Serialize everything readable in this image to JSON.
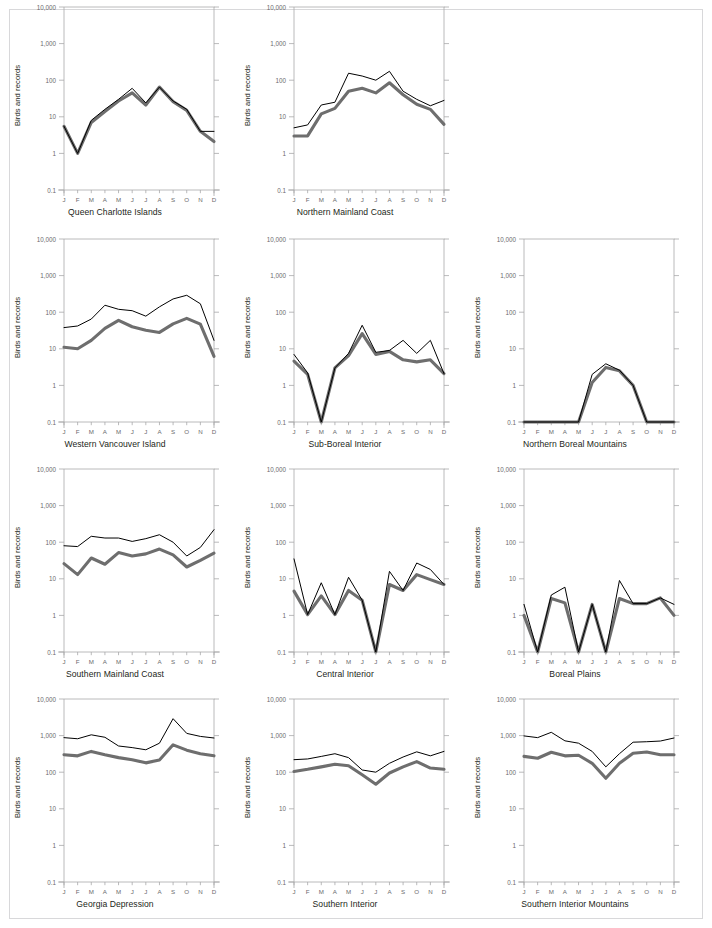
{
  "figure": {
    "axis_label_y": "Birds and records",
    "y_ticks": [
      "10,000",
      "1,000",
      "100",
      "10",
      "1",
      "0.1"
    ],
    "x_ticks": [
      "J",
      "F",
      "M",
      "A",
      "M",
      "J",
      "J",
      "A",
      "S",
      "O",
      "N",
      "D"
    ],
    "colors": {
      "records_line": "#000000",
      "birds_line": "#6e6e6e",
      "axis": "#a8a8aa",
      "frame": "#d8d8da",
      "text": "#231f20"
    },
    "layout": {
      "columns": 3,
      "rows": 4,
      "empty_cells": [
        2
      ]
    }
  },
  "chart_data": [
    {
      "type": "line",
      "title": "Queen Charlotte Islands",
      "xlabel": "",
      "ylabel": "Birds and records",
      "yscale": "log",
      "ylim": [
        0.1,
        10000
      ],
      "categories": [
        "J",
        "F",
        "M",
        "A",
        "M",
        "J",
        "J",
        "A",
        "S",
        "O",
        "N",
        "D"
      ],
      "series": [
        {
          "name": "records",
          "values": [
            5.5,
            1.0,
            8.0,
            16,
            30,
            60,
            24,
            65,
            27,
            16,
            4.0,
            4.0
          ]
        },
        {
          "name": "birds",
          "values": [
            5.5,
            1.0,
            7.0,
            14,
            27,
            45,
            21,
            65,
            26,
            15,
            4.0,
            2.1
          ]
        }
      ]
    },
    {
      "type": "line",
      "title": "Northern Mainland Coast",
      "xlabel": "",
      "ylabel": "Birds and records",
      "yscale": "log",
      "ylim": [
        0.1,
        10000
      ],
      "categories": [
        "J",
        "F",
        "M",
        "A",
        "M",
        "J",
        "J",
        "A",
        "S",
        "O",
        "N",
        "D"
      ],
      "series": [
        {
          "name": "records",
          "values": [
            5.0,
            6.0,
            21,
            25,
            155,
            130,
            100,
            175,
            50,
            30,
            20,
            28
          ]
        },
        {
          "name": "birds",
          "values": [
            3.0,
            3.0,
            12,
            17,
            50,
            60,
            45,
            85,
            40,
            22,
            16,
            6.2
          ]
        }
      ]
    },
    {
      "type": "line",
      "title": "Western Vancouver Island",
      "xlabel": "",
      "ylabel": "Birds and records",
      "yscale": "log",
      "ylim": [
        0.1,
        10000
      ],
      "categories": [
        "J",
        "F",
        "M",
        "A",
        "M",
        "J",
        "J",
        "A",
        "S",
        "O",
        "N",
        "D"
      ],
      "series": [
        {
          "name": "records",
          "values": [
            38,
            42,
            65,
            155,
            120,
            110,
            78,
            140,
            230,
            290,
            170,
            17
          ]
        },
        {
          "name": "birds",
          "values": [
            11,
            10,
            17,
            36,
            60,
            40,
            32,
            28,
            48,
            68,
            47,
            6.2
          ]
        }
      ]
    },
    {
      "type": "line",
      "title": "Sub-Boreal Interior",
      "xlabel": "",
      "ylabel": "Birds and records",
      "yscale": "log",
      "ylim": [
        0.1,
        10000
      ],
      "categories": [
        "J",
        "F",
        "M",
        "A",
        "M",
        "J",
        "J",
        "A",
        "S",
        "O",
        "N",
        "D"
      ],
      "series": [
        {
          "name": "records",
          "values": [
            7.0,
            2.2,
            0.1,
            3.0,
            7.5,
            44,
            8.0,
            9.0,
            17,
            7.5,
            17,
            2.1
          ]
        },
        {
          "name": "birds",
          "values": [
            4.6,
            2.0,
            0.1,
            3.0,
            6.5,
            26,
            7.0,
            8.5,
            5.0,
            4.4,
            5.0,
            2.1
          ]
        }
      ]
    },
    {
      "type": "line",
      "title": "Northern Boreal Mountains",
      "xlabel": "",
      "ylabel": "Birds and records",
      "yscale": "log",
      "ylim": [
        0.1,
        10000
      ],
      "categories": [
        "J",
        "F",
        "M",
        "A",
        "M",
        "J",
        "J",
        "A",
        "S",
        "O",
        "N",
        "D"
      ],
      "series": [
        {
          "name": "records",
          "values": [
            0.1,
            0.1,
            0.1,
            0.1,
            0.1,
            2.0,
            3.9,
            2.6,
            1.0,
            0.1,
            0.1,
            0.1
          ]
        },
        {
          "name": "birds",
          "values": [
            0.1,
            0.1,
            0.1,
            0.1,
            0.1,
            1.2,
            3.1,
            2.5,
            1.0,
            0.1,
            0.1,
            0.1
          ]
        }
      ]
    },
    {
      "type": "line",
      "title": "Southern Mainland Coast",
      "xlabel": "",
      "ylabel": "Birds and records",
      "yscale": "log",
      "ylim": [
        0.1,
        10000
      ],
      "categories": [
        "J",
        "F",
        "M",
        "A",
        "M",
        "J",
        "J",
        "A",
        "S",
        "O",
        "N",
        "D"
      ],
      "series": [
        {
          "name": "records",
          "values": [
            80,
            76,
            145,
            130,
            130,
            105,
            125,
            160,
            100,
            42,
            72,
            220
          ]
        },
        {
          "name": "birds",
          "values": [
            26,
            13,
            37,
            25,
            52,
            42,
            48,
            65,
            45,
            21,
            32,
            50
          ]
        }
      ]
    },
    {
      "type": "line",
      "title": "Central Interior",
      "xlabel": "",
      "ylabel": "Birds and records",
      "yscale": "log",
      "ylim": [
        0.1,
        10000
      ],
      "categories": [
        "J",
        "F",
        "M",
        "A",
        "M",
        "J",
        "J",
        "A",
        "S",
        "O",
        "N",
        "D"
      ],
      "series": [
        {
          "name": "records",
          "values": [
            35,
            1.05,
            7.8,
            1.05,
            11,
            2.6,
            0.1,
            16,
            4.8,
            27,
            18,
            7.0
          ]
        },
        {
          "name": "birds",
          "values": [
            4.6,
            1.05,
            3.4,
            1.05,
            4.8,
            2.6,
            0.1,
            7.0,
            4.8,
            13,
            9.5,
            7.0
          ]
        }
      ]
    },
    {
      "type": "line",
      "title": "Boreal Plains",
      "xlabel": "",
      "ylabel": "Birds and records",
      "yscale": "log",
      "ylim": [
        0.1,
        10000
      ],
      "categories": [
        "J",
        "F",
        "M",
        "A",
        "M",
        "J",
        "J",
        "A",
        "S",
        "O",
        "N",
        "D"
      ],
      "series": [
        {
          "name": "records",
          "values": [
            2.0,
            0.1,
            3.6,
            5.9,
            0.1,
            2.0,
            0.1,
            9.0,
            2.1,
            2.1,
            3.0,
            2.0
          ]
        },
        {
          "name": "birds",
          "values": [
            1.0,
            0.1,
            2.9,
            2.2,
            0.1,
            2.0,
            0.1,
            2.9,
            2.1,
            2.1,
            3.0,
            1.0
          ]
        }
      ]
    },
    {
      "type": "line",
      "title": "Georgia Depression",
      "xlabel": "",
      "ylabel": "Birds and records",
      "yscale": "log",
      "ylim": [
        0.1,
        10000
      ],
      "categories": [
        "J",
        "F",
        "M",
        "A",
        "M",
        "J",
        "J",
        "A",
        "S",
        "O",
        "N",
        "D"
      ],
      "series": [
        {
          "name": "records",
          "values": [
            880,
            820,
            1050,
            900,
            520,
            470,
            410,
            620,
            2900,
            1150,
            950,
            860
          ]
        },
        {
          "name": "birds",
          "values": [
            300,
            280,
            370,
            300,
            250,
            220,
            180,
            215,
            560,
            400,
            320,
            280
          ]
        }
      ]
    },
    {
      "type": "line",
      "title": "Southern Interior",
      "xlabel": "",
      "ylabel": "Birds and records",
      "yscale": "log",
      "ylim": [
        0.1,
        10000
      ],
      "categories": [
        "J",
        "F",
        "M",
        "A",
        "M",
        "J",
        "J",
        "A",
        "S",
        "O",
        "N",
        "D"
      ],
      "series": [
        {
          "name": "records",
          "values": [
            220,
            230,
            270,
            320,
            250,
            115,
            100,
            175,
            260,
            360,
            280,
            370
          ]
        },
        {
          "name": "birds",
          "values": [
            105,
            120,
            140,
            165,
            150,
            85,
            47,
            95,
            140,
            195,
            130,
            120
          ]
        }
      ]
    },
    {
      "type": "line",
      "title": "Southern Interior Mountains",
      "xlabel": "",
      "ylabel": "Birds and records",
      "yscale": "log",
      "ylim": [
        0.1,
        10000
      ],
      "categories": [
        "J",
        "F",
        "M",
        "A",
        "M",
        "J",
        "J",
        "A",
        "S",
        "O",
        "N",
        "D"
      ],
      "series": [
        {
          "name": "records",
          "values": [
            980,
            880,
            1230,
            720,
            620,
            370,
            140,
            320,
            660,
            680,
            710,
            860
          ]
        },
        {
          "name": "birds",
          "values": [
            270,
            240,
            350,
            280,
            290,
            175,
            68,
            175,
            330,
            355,
            300,
            300
          ]
        }
      ]
    }
  ]
}
